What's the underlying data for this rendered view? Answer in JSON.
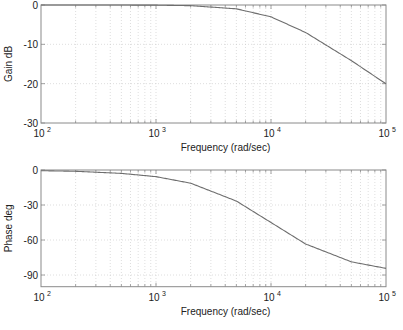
{
  "chart_data": [
    {
      "type": "line",
      "title": "",
      "xlabel": "Frequency (rad/sec)",
      "ylabel": "Gain dB",
      "xscale": "log",
      "xlim": [
        100,
        100000
      ],
      "ylim": [
        -30,
        0
      ],
      "x_ticks": [
        "10^2",
        "10^3",
        "10^4",
        "10^5"
      ],
      "y_ticks": [
        0,
        -10,
        -20,
        -30
      ],
      "grid": true,
      "series": [
        {
          "name": "Gain",
          "x": [
            100,
            200,
            500,
            1000,
            2000,
            5000,
            10000,
            20000,
            50000,
            100000
          ],
          "values": [
            0.0,
            0.0,
            -0.01,
            -0.04,
            -0.17,
            -0.97,
            -3.01,
            -6.99,
            -14.15,
            -20.04
          ]
        }
      ]
    },
    {
      "type": "line",
      "title": "",
      "xlabel": "Frequency (rad/sec)",
      "ylabel": "Phase deg",
      "xscale": "log",
      "xlim": [
        100,
        100000
      ],
      "ylim": [
        -100,
        0
      ],
      "x_ticks": [
        "10^2",
        "10^3",
        "10^4",
        "10^5"
      ],
      "y_ticks": [
        0,
        -30,
        -60,
        -90
      ],
      "grid": true,
      "series": [
        {
          "name": "Phase",
          "x": [
            100,
            200,
            500,
            1000,
            2000,
            5000,
            10000,
            20000,
            50000,
            100000
          ],
          "values": [
            -0.6,
            -1.1,
            -2.9,
            -5.7,
            -11.3,
            -26.6,
            -45.0,
            -63.4,
            -78.7,
            -84.3
          ]
        }
      ]
    }
  ],
  "plots": {
    "gain": {
      "ylabel": "Gain dB",
      "xlabel": "Frequency (rad/sec)",
      "yticks": [
        "0",
        "-10",
        "-20",
        "-30"
      ]
    },
    "phase": {
      "ylabel": "Phase deg",
      "xlabel": "Frequency (rad/sec)",
      "yticks": [
        "0",
        "-30",
        "-60",
        "-90"
      ]
    },
    "xticks": [
      {
        "base": "10",
        "exp": "2"
      },
      {
        "base": "10",
        "exp": "3"
      },
      {
        "base": "10",
        "exp": "4"
      },
      {
        "base": "10",
        "exp": "5"
      }
    ]
  },
  "colors": {
    "axis": "#8a8a8a",
    "grid": "#c8c8c8",
    "curve": "#6e6e6e",
    "text": "#222222"
  }
}
